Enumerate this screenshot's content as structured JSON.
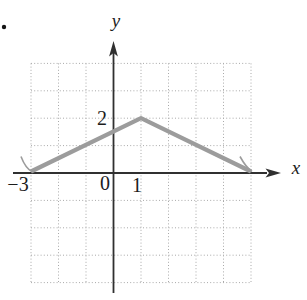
{
  "figure": {
    "bullet": "•",
    "axis_labels": {
      "x": "x",
      "y": "y"
    },
    "tick_labels": {
      "x_neg3": "−3",
      "origin": "0",
      "x_1": "1",
      "y_2": "2"
    }
  },
  "chart_data": {
    "type": "line",
    "title": "",
    "xlabel": "x",
    "ylabel": "y",
    "xlim": [
      -3,
      5
    ],
    "ylim": [
      -4,
      4
    ],
    "grid": "dotted unit squares, 8 columns x 8 rows",
    "x_tick_labels_shown": [
      "−3",
      "0",
      "1"
    ],
    "y_tick_labels_shown": [
      "2"
    ],
    "series": [
      {
        "name": "piecewise linear curve (tent function)",
        "color": "#9c9c9c",
        "points": [
          [
            -3,
            0
          ],
          [
            1,
            2
          ],
          [
            5,
            0
          ]
        ],
        "end_arrows": true,
        "description": "rises from (−3,0) to peak (1,2), falls to (5,0), small arrowheads at both ends"
      }
    ]
  },
  "colors": {
    "curve": "#9c9c9c",
    "grid": "#a9a9a9",
    "axis": "#303030",
    "text": "#1c1c1c",
    "bullet": "#151515",
    "background": "#ffffff"
  }
}
